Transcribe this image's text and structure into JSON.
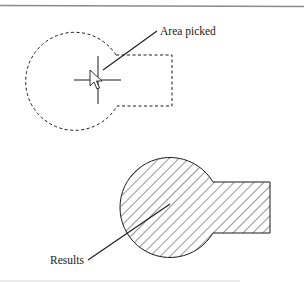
{
  "diagram": {
    "labels": {
      "area_picked": "Area picked",
      "results": "Results"
    },
    "icons": {
      "pick_cursor": "crosshair-with-arrow-cursor"
    },
    "colors": {
      "stroke": "#1a1a1a",
      "border_top": "#8a8a8a",
      "border_bottom": "#d8d8d8",
      "background": "#ffffff"
    },
    "panels": [
      {
        "name": "before",
        "style": "dashed-outline",
        "description": "Circle joined with rectangle, dashed boundary"
      },
      {
        "name": "after",
        "style": "hatched-fill",
        "description": "Same shape as a solid hatched region"
      }
    ]
  }
}
